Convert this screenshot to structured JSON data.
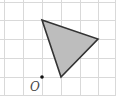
{
  "diagram": {
    "type": "grid-geometry",
    "grid": {
      "cell_size_px": 18.8,
      "vertical_lines_x": [
        4,
        23,
        42,
        61,
        80,
        98,
        115
      ],
      "horizontal_lines_y": [
        2,
        20,
        39,
        58,
        77,
        95
      ],
      "color": "#d9d9d9"
    },
    "triangle": {
      "vertices": [
        {
          "x": 42,
          "y": 20
        },
        {
          "x": 98,
          "y": 39
        },
        {
          "x": 61,
          "y": 77
        }
      ],
      "fill": "#bdbdbd",
      "stroke": "#333333"
    },
    "point": {
      "label": "O",
      "x": 42,
      "y": 77,
      "label_x": 30,
      "label_y": 91
    }
  }
}
